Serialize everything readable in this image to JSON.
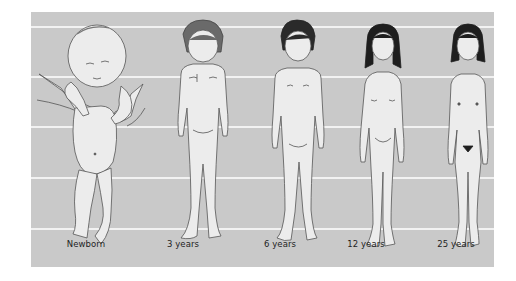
{
  "diagram": {
    "type": "growth-proportions-illustration",
    "background_color": "#c9c9c9",
    "gridline_color": "#f2f2f2",
    "gridline_count": 5,
    "figure_fill": "#ececec",
    "outline_color": "#555555",
    "figures": [
      {
        "label": "Newborn",
        "hair": "none"
      },
      {
        "label": "3 years",
        "hair": "#6a6a6a"
      },
      {
        "label": "6 years",
        "hair": "#2a2a2a"
      },
      {
        "label": "12 years",
        "hair": "#1e1e1e"
      },
      {
        "label": "25 years",
        "hair": "#1e1e1e"
      }
    ]
  }
}
